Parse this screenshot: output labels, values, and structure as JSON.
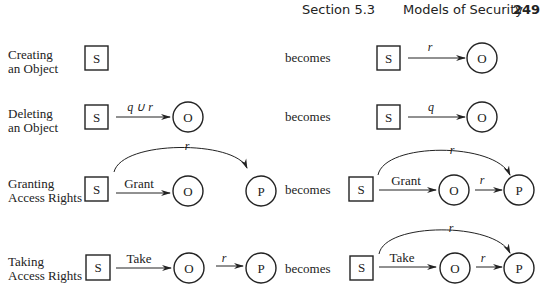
{
  "header": {
    "section": "Section 5.3",
    "title": "Models of Security",
    "page_number": "249"
  },
  "rules": [
    {
      "name": "creating",
      "label_line1": "Creating",
      "label_line2": "an Object",
      "before": {
        "subject": "S",
        "edges": []
      },
      "connector": "becomes",
      "after": {
        "subject": "S",
        "edges": [
          {
            "from": "S",
            "to": "O",
            "label": "r"
          }
        ],
        "object": "O"
      }
    },
    {
      "name": "deleting",
      "label_line1": "Deleting",
      "label_line2": "an Object",
      "before": {
        "subject": "S",
        "object": "O",
        "edges": [
          {
            "from": "S",
            "to": "O",
            "label": "q ∪ r"
          }
        ]
      },
      "connector": "becomes",
      "after": {
        "subject": "S",
        "object": "O",
        "edges": [
          {
            "from": "S",
            "to": "O",
            "label": "q"
          }
        ]
      }
    },
    {
      "name": "granting",
      "label_line1": "Granting",
      "label_line2": "Access Rights",
      "before": {
        "subject": "S",
        "object": "O",
        "third": "P",
        "edges": [
          {
            "from": "S",
            "to": "O",
            "label": "Grant"
          },
          {
            "from": "S",
            "to": "P",
            "label": "r"
          }
        ]
      },
      "connector": "becomes",
      "after": {
        "subject": "S",
        "object": "O",
        "third": "P",
        "edges": [
          {
            "from": "S",
            "to": "O",
            "label": "Grant"
          },
          {
            "from": "S",
            "to": "P",
            "label": "r"
          },
          {
            "from": "O",
            "to": "P",
            "label": "r"
          }
        ]
      }
    },
    {
      "name": "taking",
      "label_line1": "Taking",
      "label_line2": "Access Rights",
      "before": {
        "subject": "S",
        "object": "O",
        "third": "P",
        "edges": [
          {
            "from": "S",
            "to": "O",
            "label": "Take"
          },
          {
            "from": "O",
            "to": "P",
            "label": "r"
          }
        ]
      },
      "connector": "becomes",
      "after": {
        "subject": "S",
        "object": "O",
        "third": "P",
        "edges": [
          {
            "from": "S",
            "to": "O",
            "label": "Take"
          },
          {
            "from": "O",
            "to": "P",
            "label": "r"
          },
          {
            "from": "S",
            "to": "P",
            "label": "r"
          }
        ]
      }
    }
  ],
  "colors": {
    "ink": "#222222",
    "background": "#ffffff"
  }
}
